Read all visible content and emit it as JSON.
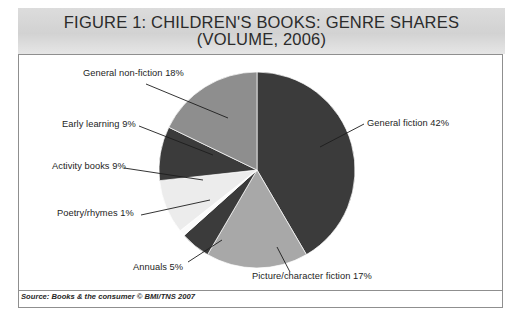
{
  "figure": {
    "title": "FIGURE 1: CHILDREN'S BOOKS: GENRE SHARES\n(VOLUME, 2006)",
    "source": "Source: Books & the consumer © BMI/TNS 2007"
  },
  "colors": {
    "general_fiction": "#3b3b3b",
    "picture_character_fiction": "#a8a8a8",
    "annuals": "#3b3b3b",
    "poetry_rhymes": "#fbfbfb",
    "activity_books": "#ececec",
    "early_learning": "#3b3b3b",
    "general_non_fiction": "#8e8e8e",
    "banner": "#d5d5d5",
    "border": "#8f8f8f",
    "leader_line": "#1d1d1d",
    "text": "#1d1d1d"
  },
  "chart_data": {
    "type": "pie",
    "title": "FIGURE 1: CHILDREN'S BOOKS: GENRE SHARES (VOLUME, 2006)",
    "xlabel": "",
    "ylabel": "",
    "unit": "%",
    "legend": "none",
    "grid": false,
    "start_angle_deg": 0,
    "direction": "clockwise",
    "categories": [
      "General fiction",
      "Picture/character fiction",
      "Annuals",
      "Poetry/rhymes",
      "Activity books",
      "Early learning",
      "General non-fiction"
    ],
    "values": [
      42,
      17,
      5,
      1,
      9,
      9,
      18
    ],
    "slices": [
      {
        "label": "General fiction 42%",
        "name": "General fiction",
        "value": 42,
        "color": "#3b3b3b"
      },
      {
        "label": "Picture/character fiction 17%",
        "name": "Picture/character fiction",
        "value": 17,
        "color": "#a8a8a8"
      },
      {
        "label": "Annuals 5%",
        "name": "Annuals",
        "value": 5,
        "color": "#3b3b3b"
      },
      {
        "label": "Poetry/rhymes 1%",
        "name": "Poetry/rhymes",
        "value": 1,
        "color": "#fbfbfb"
      },
      {
        "label": "Activity books 9%",
        "name": "Activity books",
        "value": 9,
        "color": "#ececec"
      },
      {
        "label": "Early learning 9%",
        "name": "Early learning",
        "value": 9,
        "color": "#3b3b3b"
      },
      {
        "label": "General non-fiction 18%",
        "name": "General non-fiction",
        "value": 18,
        "color": "#8e8e8e"
      }
    ]
  },
  "labels": {
    "general_non_fiction": "General non-fiction 18%",
    "early_learning": "Early learning 9%",
    "activity_books": "Activity books 9%",
    "poetry_rhymes": "Poetry/rhymes 1%",
    "annuals": "Annuals 5%",
    "picture_character_fiction": "Picture/character fiction 17%",
    "general_fiction": "General fiction 42%"
  }
}
